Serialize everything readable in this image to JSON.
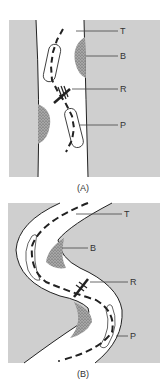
{
  "colors": {
    "tissue": "#cfcfcf",
    "lumen": "#ffffff",
    "line": "#222222",
    "stipple": "#9a9a9a"
  },
  "panels": [
    {
      "caption": "(A)",
      "labels": {
        "T": "T",
        "B": "B",
        "R": "R",
        "P": "P"
      }
    },
    {
      "caption": "(B)",
      "labels": {
        "T": "T",
        "B": "B",
        "R": "R",
        "P": "P"
      }
    }
  ]
}
